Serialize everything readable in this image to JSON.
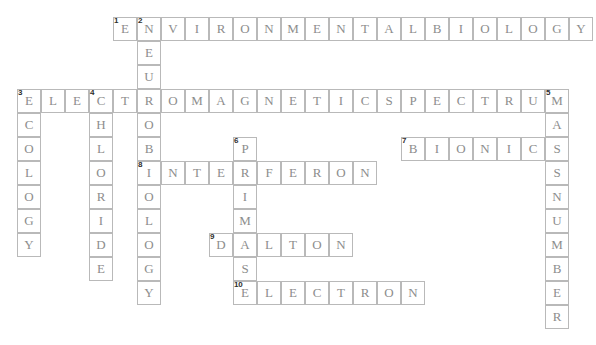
{
  "puzzle": {
    "title": "Crossword Puzzle",
    "cell_size": 24,
    "origin_x": 17,
    "origin_y": 17,
    "grid_cols": 24,
    "grid_rows": 13,
    "colors": {
      "cell_border": "#b9b9b9",
      "cell_fill": "#ffffff",
      "letter": "#8d8d8d",
      "number": "#2e2e2e",
      "background": "#ffffff"
    },
    "entries": [
      {
        "number": "1",
        "direction": "across",
        "answer": "ENVIRONMENTALBIOLOGY",
        "length": 20,
        "col": 4,
        "row": 0
      },
      {
        "number": "2",
        "direction": "down",
        "answer": "NEUROBIOLOGY",
        "length": 12,
        "col": 5,
        "row": 0
      },
      {
        "number": "3",
        "direction": "across",
        "answer": "ELECTROMAGNETICSPECTRUM",
        "length": 23,
        "col": 0,
        "row": 3
      },
      {
        "number": "3",
        "direction": "down",
        "answer": "ECOLOGY",
        "length": 7,
        "col": 0,
        "row": 3
      },
      {
        "number": "4",
        "direction": "down",
        "answer": "CHLORIDE",
        "length": 8,
        "col": 3,
        "row": 3
      },
      {
        "number": "5",
        "direction": "down",
        "answer": "MASSNUMBER",
        "length": 10,
        "col": 22,
        "row": 3
      },
      {
        "number": "6",
        "direction": "down",
        "answer": "PRIMASE",
        "length": 7,
        "col": 9,
        "row": 5
      },
      {
        "number": "7",
        "direction": "across",
        "answer": "BIONICS",
        "length": 7,
        "col": 16,
        "row": 5
      },
      {
        "number": "8",
        "direction": "across",
        "answer": "INTERFERON",
        "length": 10,
        "col": 5,
        "row": 6
      },
      {
        "number": "9",
        "direction": "across",
        "answer": "DALTON",
        "length": 6,
        "col": 8,
        "row": 9
      },
      {
        "number": "10",
        "direction": "across",
        "answer": "ELECTRON",
        "length": 8,
        "col": 9,
        "row": 11
      }
    ]
  }
}
